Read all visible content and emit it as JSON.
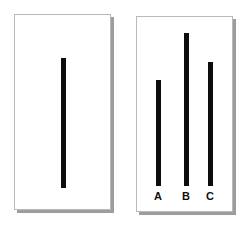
{
  "stimulus": {
    "title": "Asch Line Judgment Task",
    "background_color": "#ffffff",
    "line_color": "#0d0d0d",
    "card_border_color": "#b9b9b9",
    "card_shadow_color": "#9d9d9d",
    "card_fill_color": "#ffffff",
    "label_color": "#111111"
  },
  "reference_card": {
    "name": "reference-card",
    "x": 14,
    "y": 14,
    "width": 97,
    "height": 196,
    "line": {
      "label": "",
      "x": 61,
      "y": 58,
      "width": 5,
      "height": 130
    }
  },
  "comparison_card": {
    "name": "comparison-card",
    "x": 136,
    "y": 16,
    "width": 97,
    "height": 196,
    "lines": [
      {
        "label": "A",
        "x": 156,
        "y": 80,
        "width": 5,
        "height": 106,
        "label_x": 151,
        "label_y": 190
      },
      {
        "label": "B",
        "x": 184,
        "y": 33,
        "width": 5,
        "height": 153,
        "label_x": 179,
        "label_y": 190
      },
      {
        "label": "C",
        "x": 208,
        "y": 62,
        "width": 5,
        "height": 124,
        "label_x": 203,
        "label_y": 190
      }
    ]
  },
  "chart_data": {
    "type": "bar",
    "xlabel": "",
    "ylabel": "Line length (px)",
    "categories": [
      "Reference",
      "A",
      "B",
      "C"
    ],
    "values": [
      130,
      106,
      153,
      124
    ],
    "series": [
      {
        "name": "Line length",
        "values": [
          130,
          106,
          153,
          124
        ]
      }
    ],
    "ylim": [
      0,
      160
    ],
    "grid": false,
    "legend": "none",
    "annotations": [
      "Left card shows the single reference line",
      "Right card shows three comparison lines labeled A, B and C",
      "Line C is equal in length to the reference line"
    ]
  }
}
